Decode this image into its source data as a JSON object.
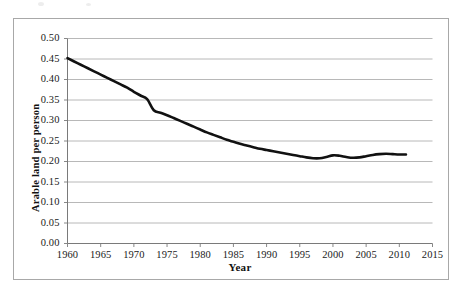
{
  "figure": {
    "background_color": "#ffffff",
    "frame_color": "#a8a8a8",
    "gridline_color": "#b0b0b0",
    "line_color": "#111111",
    "axis_color": "#7a7a7a"
  },
  "chart_data": {
    "type": "line",
    "title": "",
    "xlabel": "Year",
    "ylabel": "Arable land per person",
    "xlim": [
      1960,
      2015
    ],
    "ylim": [
      0.0,
      0.5
    ],
    "grid": true,
    "grid_axis": "y",
    "legend": false,
    "legend_position": "none",
    "xticks": [
      1960,
      1965,
      1970,
      1975,
      1980,
      1985,
      1990,
      1995,
      2000,
      2005,
      2010,
      2015
    ],
    "xtick_labels": [
      "1960",
      "1965",
      "1970",
      "1975",
      "1980",
      "1985",
      "1990",
      "1995",
      "2000",
      "2005",
      "2010",
      "2015"
    ],
    "yticks": [
      0.0,
      0.05,
      0.1,
      0.15,
      0.2,
      0.25,
      0.3,
      0.35,
      0.4,
      0.45,
      0.5
    ],
    "ytick_labels": [
      "0.00",
      "0.05",
      "0.10",
      "0.15",
      "0.20",
      "0.25",
      "0.30",
      "0.35",
      "0.40",
      "0.45",
      "0.50"
    ],
    "series": [
      {
        "name": "Arable land per person",
        "line_width": 2.6,
        "x": [
          1960,
          1961,
          1962,
          1963,
          1964,
          1965,
          1966,
          1967,
          1968,
          1969,
          1970,
          1971,
          1972,
          1973,
          1974,
          1975,
          1976,
          1977,
          1978,
          1979,
          1980,
          1981,
          1982,
          1983,
          1984,
          1985,
          1986,
          1987,
          1988,
          1989,
          1990,
          1991,
          1992,
          1993,
          1994,
          1995,
          1996,
          1997,
          1998,
          1999,
          2000,
          2001,
          2002,
          2003,
          2004,
          2005,
          2006,
          2007,
          2008,
          2009,
          2010,
          2011
        ],
        "y": [
          0.452,
          0.444,
          0.436,
          0.428,
          0.42,
          0.412,
          0.404,
          0.396,
          0.388,
          0.38,
          0.37,
          0.361,
          0.352,
          0.325,
          0.319,
          0.313,
          0.306,
          0.299,
          0.292,
          0.285,
          0.278,
          0.271,
          0.265,
          0.259,
          0.253,
          0.248,
          0.243,
          0.239,
          0.235,
          0.231,
          0.228,
          0.225,
          0.222,
          0.219,
          0.216,
          0.213,
          0.21,
          0.208,
          0.208,
          0.211,
          0.215,
          0.214,
          0.211,
          0.209,
          0.21,
          0.213,
          0.216,
          0.218,
          0.219,
          0.218,
          0.217,
          0.217
        ]
      }
    ]
  }
}
